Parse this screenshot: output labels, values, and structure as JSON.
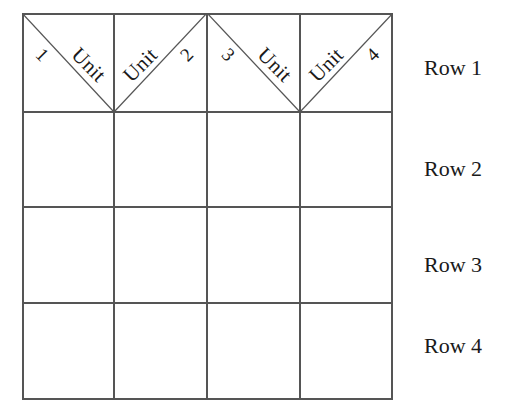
{
  "figure": {
    "background_color": "#ffffff",
    "line_color": "#555555",
    "text_color": "#1a1a1a"
  },
  "grid": {
    "columns": 4,
    "rows": 4,
    "left": 22,
    "top": 13,
    "width": 371,
    "height": 387,
    "column_edges": [
      0,
      92,
      185,
      278,
      371
    ],
    "row_edges": [
      0,
      99,
      194,
      290,
      387
    ]
  },
  "unit_cells": [
    {
      "word": "Unit",
      "number": "1",
      "diagonal": "main"
    },
    {
      "word": "Unit",
      "number": "2",
      "diagonal": "anti"
    },
    {
      "word": "Unit",
      "number": "3",
      "diagonal": "main"
    },
    {
      "word": "Unit",
      "number": "4",
      "diagonal": "anti"
    }
  ],
  "row_labels": [
    {
      "label": "Row 1",
      "top": 57
    },
    {
      "label": "Row 2",
      "top": 158
    },
    {
      "label": "Row 3",
      "top": 254
    },
    {
      "label": "Row 4",
      "top": 335
    }
  ]
}
